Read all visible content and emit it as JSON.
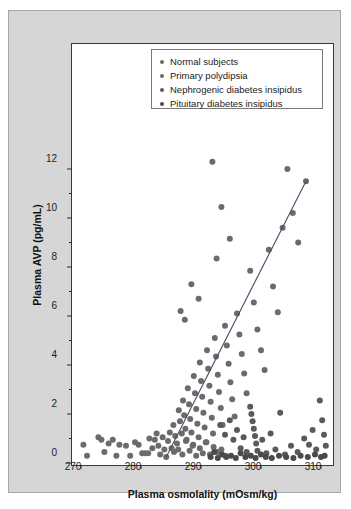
{
  "figure": {
    "panel_bg": "#d6d6d6",
    "plot_bg": "#ffffff",
    "frame_color": "#3a3a3a"
  },
  "legend": {
    "position": "top-center-inside",
    "border_color": "#7a7a7a",
    "items": [
      {
        "label": "Normal subjects",
        "color": "#6b6b6b",
        "marker": "circle"
      },
      {
        "label": "Primary polydipsia",
        "color": "#6b6b6b",
        "marker": "circle"
      },
      {
        "label": "Nephrogenic diabetes insipidus",
        "color": "#5a5a5a",
        "marker": "circle"
      },
      {
        "label": "Pituitary diabetes insipidus",
        "color": "#4a4a4a",
        "marker": "circle"
      }
    ]
  },
  "chart_data": {
    "type": "scatter",
    "title": "",
    "xlabel": "Plasma osmolality (mOsm/kg)",
    "ylabel": "Plasma AVP (pg/mL)",
    "xlim": [
      268,
      312
    ],
    "ylim": [
      0,
      12.8
    ],
    "xticks": [
      270,
      280,
      290,
      300,
      310
    ],
    "yticks": [
      0,
      2,
      4,
      6,
      8,
      10,
      12
    ],
    "yminorticks": [
      1,
      3,
      5,
      7,
      9,
      11
    ],
    "grid": false,
    "marker_color": "#666666",
    "marker_size": 3.0,
    "trendline": {
      "color": "#4a4a6a",
      "x_start": 284.2,
      "y_start": 0.25,
      "x_end": 307.6,
      "y_end": 11.55
    },
    "series": [
      {
        "name": "Normal subjects",
        "color": "#6b6b6b",
        "points": [
          [
            270.4,
            0.75
          ],
          [
            271.0,
            0.3
          ],
          [
            272.9,
            1.05
          ],
          [
            273.4,
            0.95
          ],
          [
            273.9,
            0.45
          ],
          [
            274.6,
            0.8
          ],
          [
            275.3,
            0.95
          ],
          [
            275.9,
            0.3
          ],
          [
            276.4,
            0.75
          ],
          [
            277.5,
            0.7
          ],
          [
            278.2,
            0.3
          ],
          [
            279.0,
            0.85
          ],
          [
            279.6,
            0.75
          ],
          [
            280.2,
            0.4
          ],
          [
            280.7,
            0.4
          ],
          [
            281.2,
            0.4
          ],
          [
            281.4,
            1.0
          ],
          [
            281.9,
            0.6
          ],
          [
            282.3,
            0.95
          ],
          [
            282.6,
            1.2
          ],
          [
            282.9,
            0.7
          ],
          [
            283.2,
            0.35
          ],
          [
            283.6,
            1.05
          ],
          [
            283.9,
            0.55
          ],
          [
            284.2,
            0.25
          ],
          [
            284.5,
            0.9
          ],
          [
            284.8,
            1.25
          ],
          [
            285.1,
            0.6
          ],
          [
            285.4,
            1.55
          ],
          [
            285.7,
            1.1
          ],
          [
            286.0,
            0.8
          ],
          [
            286.3,
            2.15
          ],
          [
            286.5,
            1.7
          ],
          [
            286.8,
            1.2
          ],
          [
            287.0,
            2.55
          ],
          [
            287.2,
            1.95
          ],
          [
            287.4,
            1.4
          ],
          [
            287.6,
            0.95
          ],
          [
            287.8,
            3.05
          ],
          [
            288.0,
            2.4
          ],
          [
            288.2,
            1.8
          ],
          [
            288.4,
            1.25
          ],
          [
            288.6,
            0.7
          ],
          [
            288.8,
            3.55
          ],
          [
            289.0,
            2.85
          ],
          [
            289.2,
            2.2
          ],
          [
            289.4,
            1.6
          ],
          [
            289.6,
            1.05
          ],
          [
            289.8,
            4.1
          ],
          [
            290.0,
            3.35
          ],
          [
            290.2,
            2.7
          ],
          [
            290.4,
            2.05
          ],
          [
            290.6,
            1.45
          ],
          [
            290.8,
            0.85
          ],
          [
            291.0,
            4.6
          ],
          [
            291.2,
            3.85
          ],
          [
            291.4,
            3.15
          ],
          [
            291.6,
            2.5
          ],
          [
            291.8,
            1.85
          ],
          [
            292.0,
            1.2
          ],
          [
            292.3,
            5.1
          ],
          [
            292.5,
            4.35
          ],
          [
            292.8,
            3.6
          ],
          [
            293.0,
            2.9
          ],
          [
            293.3,
            2.25
          ],
          [
            293.6,
            1.55
          ],
          [
            294.0,
            5.6
          ],
          [
            294.3,
            4.8
          ],
          [
            294.6,
            4.05
          ],
          [
            294.9,
            3.3
          ],
          [
            295.2,
            2.6
          ],
          [
            295.6,
            1.9
          ],
          [
            296.0,
            6.1
          ],
          [
            296.4,
            5.25
          ],
          [
            296.8,
            4.45
          ],
          [
            297.2,
            3.65
          ],
          [
            297.6,
            2.85
          ],
          [
            298.2,
            7.85
          ],
          [
            298.8,
            6.55
          ],
          [
            299.4,
            5.45
          ],
          [
            300.0,
            4.6
          ],
          [
            300.6,
            3.8
          ],
          [
            301.3,
            8.7
          ],
          [
            302.0,
            7.2
          ],
          [
            302.8,
            6.15
          ],
          [
            303.6,
            9.6
          ],
          [
            304.4,
            12.0
          ],
          [
            305.3,
            10.2
          ],
          [
            306.2,
            9.0
          ],
          [
            307.5,
            11.5
          ]
        ]
      },
      {
        "name": "Primary polydipsia",
        "color": "#6b6b6b",
        "points": [
          [
            285.5,
            0.45
          ],
          [
            286.2,
            0.55
          ],
          [
            286.9,
            0.35
          ],
          [
            287.5,
            0.9
          ],
          [
            288.1,
            0.5
          ],
          [
            288.7,
            0.75
          ],
          [
            289.2,
            0.3
          ],
          [
            289.8,
            0.6
          ],
          [
            290.3,
            0.4
          ],
          [
            290.9,
            0.85
          ],
          [
            291.5,
            0.35
          ],
          [
            292.1,
            0.65
          ],
          [
            292.7,
            0.45
          ],
          [
            293.4,
            0.55
          ],
          [
            294.1,
            0.3
          ],
          [
            286.6,
            6.2
          ],
          [
            287.3,
            5.85
          ],
          [
            288.4,
            7.3
          ],
          [
            289.6,
            6.7
          ],
          [
            291.9,
            12.3
          ],
          [
            292.6,
            8.35
          ],
          [
            293.4,
            10.45
          ],
          [
            294.8,
            9.15
          ]
        ]
      },
      {
        "name": "Nephrogenic diabetes insipidus",
        "color": "#5a5a5a",
        "points": [
          [
            293.2,
            1.55
          ],
          [
            294.0,
            1.15
          ],
          [
            294.8,
            1.75
          ],
          [
            295.4,
            0.95
          ],
          [
            296.0,
            1.35
          ],
          [
            296.6,
            0.6
          ],
          [
            297.1,
            1.05
          ],
          [
            297.6,
            0.45
          ],
          [
            298.2,
            2.3
          ],
          [
            298.4,
            2.0
          ],
          [
            298.6,
            1.7
          ],
          [
            298.8,
            1.4
          ],
          [
            299.0,
            1.1
          ],
          [
            299.2,
            0.8
          ],
          [
            299.4,
            0.5
          ],
          [
            300.2,
            0.95
          ],
          [
            300.9,
            0.4
          ],
          [
            301.6,
            1.2
          ],
          [
            302.4,
            0.55
          ],
          [
            303.2,
            2.05
          ],
          [
            304.0,
            0.35
          ],
          [
            305.0,
            0.7
          ],
          [
            306.1,
            0.45
          ],
          [
            307.2,
            1.0
          ],
          [
            308.0,
            0.75
          ],
          [
            308.6,
            1.35
          ],
          [
            309.2,
            0.55
          ],
          [
            309.8,
            2.55
          ],
          [
            310.2,
            1.75
          ],
          [
            310.5,
            1.15
          ],
          [
            310.8,
            0.7
          ]
        ]
      },
      {
        "name": "Pituitary diabetes insipidus",
        "color": "#4a4a4a",
        "points": [
          [
            291.6,
            0.25
          ],
          [
            292.2,
            0.45
          ],
          [
            292.8,
            0.2
          ],
          [
            293.5,
            0.35
          ],
          [
            294.2,
            0.25
          ],
          [
            295.0,
            0.3
          ],
          [
            295.8,
            0.2
          ],
          [
            296.6,
            0.4
          ],
          [
            297.4,
            0.25
          ],
          [
            298.3,
            0.3
          ],
          [
            299.1,
            0.2
          ],
          [
            300.0,
            0.35
          ],
          [
            300.8,
            0.25
          ],
          [
            301.8,
            0.2
          ],
          [
            303.0,
            0.3
          ],
          [
            304.2,
            0.25
          ],
          [
            305.4,
            0.2
          ],
          [
            306.6,
            0.3
          ],
          [
            307.8,
            0.25
          ],
          [
            309.0,
            0.35
          ],
          [
            310.0,
            0.25
          ],
          [
            310.6,
            0.3
          ]
        ]
      }
    ]
  }
}
